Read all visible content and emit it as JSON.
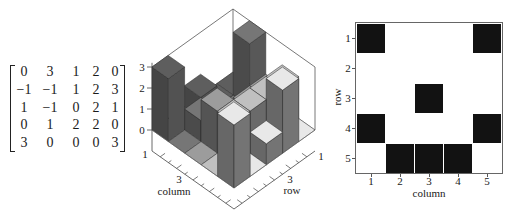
{
  "chart_data": [
    {
      "type": "table",
      "title": "",
      "rows": [
        [
          "0",
          "3",
          "1",
          "2",
          "0"
        ],
        [
          "−1",
          "−1",
          "1",
          "2",
          "3"
        ],
        [
          "1",
          "−1",
          "0",
          "2",
          "1"
        ],
        [
          "0",
          "1",
          "2",
          "2",
          "0"
        ],
        [
          "3",
          "0",
          "0",
          "0",
          "3"
        ]
      ]
    },
    {
      "type": "bar",
      "subtype": "bar3d",
      "title": "",
      "matrix": [
        [
          0,
          3,
          1,
          2,
          0
        ],
        [
          -1,
          -1,
          1,
          2,
          3
        ],
        [
          1,
          -1,
          0,
          2,
          1
        ],
        [
          0,
          1,
          2,
          2,
          0
        ],
        [
          3,
          0,
          0,
          0,
          3
        ]
      ],
      "xlabel": "column",
      "ylabel": "row",
      "zlabel": "",
      "zlim": [
        0,
        3
      ],
      "zticks": [
        "0",
        "1",
        "2",
        "3"
      ],
      "xticks": [
        "1",
        "3"
      ],
      "yticks": [
        "1",
        "3"
      ],
      "grid": false,
      "column_colors": [
        "#5e5e5e",
        "#767676",
        "#9c9c9c",
        "#c0c0c0",
        "#e8e8e8"
      ]
    },
    {
      "type": "heatmap",
      "title": "",
      "xlabel": "column",
      "ylabel": "row",
      "xticks": [
        "1",
        "2",
        "3",
        "4",
        "5"
      ],
      "yticks": [
        "1",
        "2",
        "3",
        "4",
        "5"
      ],
      "values": [
        [
          1,
          0,
          0,
          0,
          1
        ],
        [
          0,
          0,
          0,
          0,
          0
        ],
        [
          0,
          0,
          1,
          0,
          0
        ],
        [
          1,
          0,
          0,
          0,
          1
        ],
        [
          0,
          1,
          1,
          1,
          0
        ]
      ],
      "on_color": "#121212",
      "off_color": "#ffffff"
    }
  ]
}
